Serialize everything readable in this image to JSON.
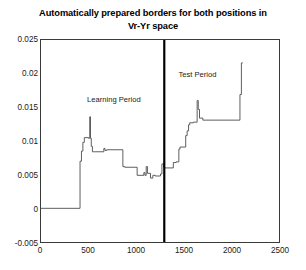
{
  "chart_data": {
    "type": "line",
    "title": "Automatically prepared borders for both positions in Vr-Yr space",
    "title_line1": "Automatically prepared borders for both positions in",
    "title_line2": "Vr-Yr space",
    "xlabel": "",
    "ylabel": "",
    "xlim": [
      0,
      2500
    ],
    "ylim": [
      -0.005,
      0.025
    ],
    "xticks": [
      0,
      500,
      1000,
      1500,
      2000,
      2500
    ],
    "xtick_labels": [
      "0",
      "500",
      "1000",
      "1500",
      "2000",
      "2500"
    ],
    "yticks": [
      -0.005,
      0,
      0.005,
      0.01,
      0.015,
      0.02,
      0.025
    ],
    "ytick_labels": [
      "-0.005",
      "0",
      "0.005",
      "0.01",
      "0.015",
      "0.02",
      "0.025"
    ],
    "grid": false,
    "legend": null,
    "line_color": "#4d4d4d",
    "divider_color": "#000000",
    "annotations": [
      {
        "text": "Learning Period",
        "x": 770,
        "y": 0.0168
      },
      {
        "text": "Test Period",
        "x": 1640,
        "y": 0.0205
      }
    ],
    "divider": {
      "x": 1295,
      "label": "period-divider"
    },
    "x": [
      0,
      410,
      410,
      425,
      425,
      440,
      440,
      455,
      455,
      500,
      500,
      512,
      512,
      520,
      520,
      528,
      528,
      540,
      540,
      560,
      560,
      660,
      660,
      672,
      672,
      690,
      690,
      860,
      860,
      880,
      880,
      1010,
      1010,
      1080,
      1080,
      1092,
      1092,
      1105,
      1105,
      1118,
      1118,
      1150,
      1150,
      1175,
      1175,
      1200,
      1200,
      1255,
      1255,
      1270,
      1270,
      1290,
      1290,
      1300,
      1300,
      1390,
      1390,
      1420,
      1420,
      1448,
      1448,
      1460,
      1460,
      1520,
      1520,
      1535,
      1535,
      1550,
      1550,
      1562,
      1562,
      1600,
      1600,
      1640,
      1640,
      1652,
      1652,
      1665,
      1665,
      1700,
      1700,
      2090,
      2090,
      2105,
      2105,
      2120,
      2120,
      2300
    ],
    "y": [
      0.0,
      0.0,
      0.007,
      0.007,
      0.0085,
      0.0085,
      0.0098,
      0.0098,
      0.0105,
      0.0105,
      0.0104,
      0.0104,
      0.0136,
      0.0136,
      0.0104,
      0.0104,
      0.0092,
      0.0092,
      0.0084,
      0.0084,
      0.0084,
      0.0084,
      0.0089,
      0.0089,
      0.0086,
      0.0086,
      0.0087,
      0.0087,
      0.0062,
      0.0062,
      0.0061,
      0.0061,
      0.0049,
      0.0049,
      0.0053,
      0.0053,
      0.0049,
      0.0049,
      0.0062,
      0.0062,
      0.0052,
      0.0052,
      0.0045,
      0.0045,
      0.0049,
      0.0049,
      0.0048,
      0.0048,
      0.0051,
      0.0051,
      0.0066,
      0.0066,
      0.0061,
      0.0061,
      0.006,
      0.006,
      0.0068,
      0.0068,
      0.0069,
      0.0069,
      0.0088,
      0.0088,
      0.0091,
      0.0091,
      0.0108,
      0.0108,
      0.0115,
      0.0115,
      0.0124,
      0.0124,
      0.0127,
      0.0127,
      0.0128,
      0.0128,
      0.016,
      0.016,
      0.0147,
      0.0147,
      0.0134,
      0.0134,
      0.0131,
      0.0131,
      0.0169,
      0.0169,
      0.0216,
      0.0216,
      0.0216
    ]
  }
}
